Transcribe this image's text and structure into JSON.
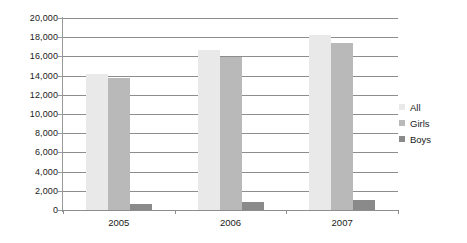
{
  "chart_data": {
    "type": "bar",
    "title": "",
    "subtitle": "",
    "xlabel": "",
    "ylabel": "",
    "categories": [
      "2005",
      "2006",
      "2007"
    ],
    "series": [
      {
        "name": "All",
        "values": [
          14200,
          16700,
          18200
        ],
        "color": "#e9e9e9"
      },
      {
        "name": "Girls",
        "values": [
          13700,
          15900,
          17400
        ],
        "color": "#b9b9b9"
      },
      {
        "name": "Boys",
        "values": [
          600,
          800,
          1000
        ],
        "color": "#8a8a8a"
      }
    ],
    "ylim": [
      0,
      20000
    ],
    "ytick_step": 2000,
    "ytick_labels": [
      "0",
      "2,000",
      "4,000",
      "6,000",
      "8,000",
      "10,000",
      "12,000",
      "14,000",
      "16,000",
      "18,000",
      "20,000"
    ],
    "ytick_values": [
      0,
      2000,
      4000,
      6000,
      8000,
      10000,
      12000,
      14000,
      16000,
      18000,
      20000
    ],
    "grid": true,
    "grid_axis": "y",
    "legend_position": "right",
    "legend_entries": [
      "All",
      "Girls",
      "Boys"
    ],
    "plot_background": "#ffffff",
    "grid_color": "#8d8d8d",
    "axis_color": "#8d8d8d",
    "text_color": "#1a1a1a"
  }
}
